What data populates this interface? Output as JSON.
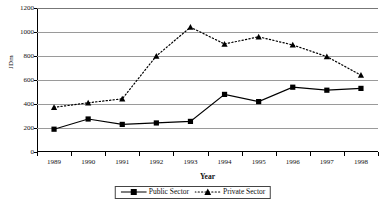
{
  "chart_data": {
    "type": "line",
    "title": "",
    "xlabel": "Year",
    "ylabel": "JDm",
    "categories": [
      "1989",
      "1990",
      "1991",
      "1992",
      "1993",
      "1994",
      "1995",
      "1996",
      "1997",
      "1998"
    ],
    "ylim": [
      0,
      1200
    ],
    "ytick_values": [
      0,
      200,
      400,
      600,
      800,
      1000,
      1200
    ],
    "ytick_labels": [
      "0",
      "200",
      "400",
      "600",
      "800",
      "1000",
      "1200"
    ],
    "grid": true,
    "legend_position": "bottom",
    "series": [
      {
        "name": "Public Sector",
        "marker": "square",
        "line_style": "solid",
        "color": "#000000",
        "values": [
          190,
          275,
          230,
          242,
          255,
          480,
          420,
          540,
          515,
          530
        ]
      },
      {
        "name": "Private Sector",
        "marker": "triangle",
        "line_style": "dotted",
        "color": "#000000",
        "values": [
          372,
          410,
          443,
          800,
          1040,
          900,
          960,
          892,
          795,
          640
        ]
      }
    ]
  },
  "axes": {
    "y_title": "JDm",
    "x_title": "Year"
  },
  "legend": {
    "items": [
      {
        "label": "Public Sector"
      },
      {
        "label": "Private Sector"
      }
    ]
  }
}
